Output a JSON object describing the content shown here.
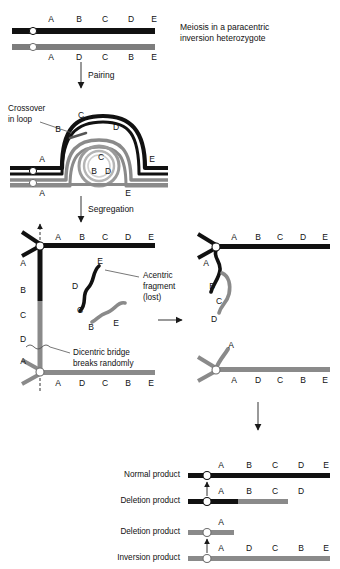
{
  "figure": {
    "title_caption": "Meiosis in a paracentric inversion heterozygote",
    "colors": {
      "normal_chromatid": "#111111",
      "inverted_chromatid": "#7d7d7d",
      "centromere_fill": "#ffffff",
      "background": "#ffffff",
      "text": "#111111"
    }
  },
  "stage_top": {
    "caption_line1": "Meiosis in a paracentric",
    "caption_line2": "inversion heterozygote",
    "normal_genes": [
      "A",
      "B",
      "C",
      "D",
      "E"
    ],
    "inverted_genes": [
      "A",
      "D",
      "C",
      "B",
      "E"
    ],
    "arrow_label": "Pairing"
  },
  "stage_loop": {
    "label_line1": "Crossover",
    "label_line2": "in loop",
    "outer_genes": [
      "B",
      "C",
      "D"
    ],
    "inner_genes": [
      "B",
      "C",
      "D"
    ],
    "left_gene_black": "A",
    "left_gene_gray": "A",
    "right_gene_black": "E",
    "right_gene_gray": "E",
    "arrow_label": "Segregation"
  },
  "stage_bridge": {
    "top_chromatid_genes": [
      "A",
      "B",
      "C",
      "D",
      "E"
    ],
    "bottom_chromatid_genes": [
      "A",
      "D",
      "C",
      "B",
      "E"
    ],
    "bridge_genes": [
      "A",
      "B",
      "C",
      "D",
      "A"
    ],
    "acentric_label_line1": "Acentric",
    "acentric_label_line2": "fragment",
    "acentric_label_line3": "(lost)",
    "acentric_black_genes": [
      "E",
      "D",
      "C"
    ],
    "acentric_gray_genes": [
      "B",
      "E"
    ],
    "dicentric_label_line1": "Dicentric bridge",
    "dicentric_label_line2": "breaks randomly"
  },
  "stage_broken": {
    "black_product_genes": [
      "A",
      "B",
      "C",
      "D",
      "E"
    ],
    "black_tail_genes": [
      "A",
      "B",
      "C",
      "D"
    ],
    "gray_product_genes": [
      "A",
      "D",
      "C",
      "B",
      "E"
    ],
    "gray_tail_gene": "A"
  },
  "stage_products": {
    "rows": [
      {
        "label": "Normal product",
        "genes": [
          "A",
          "B",
          "C",
          "D",
          "E"
        ]
      },
      {
        "label": "Deletion product",
        "genes": [
          "A",
          "B",
          "C",
          "D"
        ]
      },
      {
        "label": "Deletion product",
        "genes": [
          "A"
        ]
      },
      {
        "label": "Inversion product",
        "genes": [
          "A",
          "D",
          "C",
          "B",
          "E"
        ]
      }
    ]
  }
}
